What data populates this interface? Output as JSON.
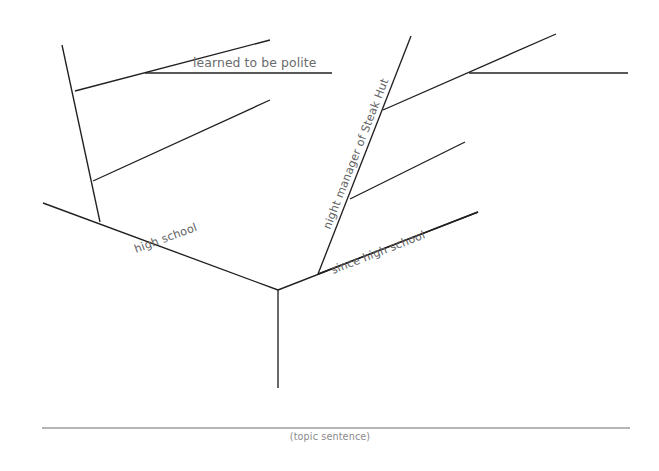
{
  "page": {
    "width": 659,
    "height": 471,
    "background_color": "#ffffff",
    "line_color": "#231f20",
    "label_color": "#636466",
    "topic_line_color": "#6d6d6d"
  },
  "chart_data": {
    "type": "diagram",
    "subtype": "idea-tree",
    "nodes": [
      {
        "id": "trunk-base",
        "x": 278,
        "y": 388,
        "label": ""
      },
      {
        "id": "fork",
        "x": 278,
        "y": 290,
        "label": ""
      },
      {
        "id": "left-main-end",
        "x": 43,
        "y": 203,
        "label": "high school"
      },
      {
        "id": "right-main-end",
        "x": 478,
        "y": 212,
        "label": "since high school"
      },
      {
        "id": "left-stem-top",
        "x": 62,
        "y": 45,
        "label": ""
      },
      {
        "id": "night-manager-top",
        "x": 411,
        "y": 36,
        "label": "night manager of Steak Hut"
      }
    ],
    "filled_labels": [
      "learned to be polite",
      "night manager of Steak Hut"
    ],
    "empty_slots": 4
  },
  "branches": {
    "trunk": {
      "name": "trunk",
      "x1": 278,
      "y1": 290,
      "x2": 278,
      "y2": 388
    },
    "left_main": {
      "name": "high-school-branch",
      "label": "high school",
      "x1": 278,
      "y1": 290,
      "x2": 43,
      "y2": 203,
      "label_x": 136,
      "label_y": 253,
      "label_rotate": -20.3
    },
    "right_main": {
      "name": "since-high-school-branch",
      "label": "since high school",
      "x1": 278,
      "y1": 290,
      "x2": 478,
      "y2": 212,
      "label_x": 333,
      "label_y": 274,
      "label_rotate": -21.3
    },
    "left_stem": {
      "name": "high-school-vertical-stem",
      "x1": 100,
      "y1": 222,
      "x2": 62,
      "y2": 45
    },
    "right_stem": {
      "name": "night-manager-stem",
      "label": "night manager of Steak Hut",
      "x1": 318,
      "y1": 274,
      "x2": 411,
      "y2": 36,
      "label_x": 330,
      "label_y": 230,
      "label_rotate": -68.6
    }
  },
  "sub_branches": [
    {
      "name": "left-sub-branch-upper",
      "x1": 75,
      "y1": 91,
      "x2": 270,
      "y2": 40,
      "filled": true,
      "label": "learned to be polite",
      "write_line": {
        "x1": 145,
        "y1": 73,
        "x2": 332,
        "y2": 73
      },
      "label_x": 193,
      "label_y": 67
    },
    {
      "name": "left-sub-branch-lower",
      "x1": 93,
      "y1": 181,
      "x2": 270,
      "y2": 100,
      "filled": false,
      "label": "",
      "write_line": null,
      "label_x": 0,
      "label_y": 0
    },
    {
      "name": "right-sub-branch-upper",
      "x1": 383,
      "y1": 110,
      "x2": 556,
      "y2": 34,
      "filled": true,
      "label": "",
      "write_line": {
        "x1": 469,
        "y1": 73,
        "x2": 628,
        "y2": 73
      },
      "label_x": 0,
      "label_y": 0
    },
    {
      "name": "right-sub-branch-middle",
      "x1": 350,
      "y1": 199,
      "x2": 465,
      "y2": 142,
      "filled": false,
      "label": "",
      "write_line": null,
      "label_x": 0,
      "label_y": 0
    },
    {
      "name": "right-sub-branch-lower",
      "x1": 318,
      "y1": 274,
      "x2": 478,
      "y2": 212,
      "filled": false,
      "label": "",
      "write_line": null,
      "label_x": 0,
      "label_y": 0
    }
  ],
  "topic_sentence": {
    "caption": "(topic sentence)",
    "line": {
      "x1": 42,
      "y1": 428,
      "x2": 630,
      "y2": 428
    },
    "caption_x": 330,
    "caption_y": 440
  }
}
